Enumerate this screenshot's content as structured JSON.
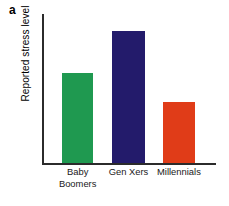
{
  "figure": {
    "panel_label": "a",
    "background_color": "#ffffff",
    "axis_color": "#2b2b2b"
  },
  "chart_data": {
    "type": "bar",
    "title": "",
    "subtitle": "",
    "xlabel": "",
    "ylabel": "Reported stress level",
    "categories": [
      "Baby Boomers",
      "Gen Xers",
      "Millennials"
    ],
    "category_lines": [
      [
        "Baby",
        "Boomers"
      ],
      [
        "Gen Xers"
      ],
      [
        "Millennials"
      ]
    ],
    "values": [
      0.6,
      0.885,
      0.41
    ],
    "ylim": [
      0,
      1
    ],
    "xlim": [
      0,
      1
    ],
    "grid": false,
    "legend": null,
    "tick_labels_y": [],
    "annotations": [],
    "bars": [
      {
        "label": "Baby Boomers",
        "value": 0.6,
        "color": "#1f9950",
        "x_left_pct": 11.5,
        "width_pct": 18.0,
        "height_pct": 60.4
      },
      {
        "label": "Gen Xers",
        "value": 0.885,
        "color": "#231b6b",
        "x_left_pct": 40.2,
        "width_pct": 19.0,
        "height_pct": 88.6
      },
      {
        "label": "Millennials",
        "value": 0.41,
        "color": "#e03c18",
        "x_left_pct": 69.5,
        "width_pct": 18.4,
        "height_pct": 41.0
      }
    ],
    "tick_positions_pct": [
      20.5,
      49.7,
      78.7
    ]
  }
}
